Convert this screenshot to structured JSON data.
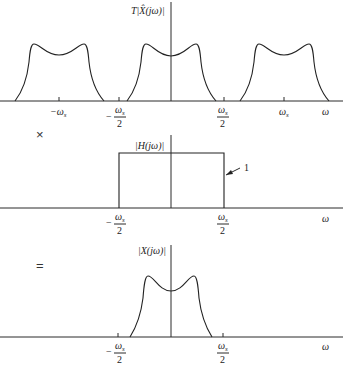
{
  "figure": {
    "type": "sampling-reconstruction-diagram",
    "panels": [
      {
        "id": "sampled-spectrum",
        "ylabel": "T|X̂(jω)|",
        "xlabel": "ω",
        "lobe_centers": [
          "-ω_s",
          "0",
          "ω_s"
        ],
        "ticks": [
          {
            "label_num": "−ω",
            "label_sub": "s",
            "kind": "plain",
            "at": "-ws"
          },
          {
            "label_num": "ω",
            "label_sub": "s",
            "kind": "frac-neg",
            "at": "-ws/2"
          },
          {
            "label_num": "ω",
            "label_sub": "s",
            "kind": "frac",
            "at": "ws/2"
          },
          {
            "label_num": "ω",
            "label_sub": "s",
            "kind": "plain",
            "at": "ws"
          }
        ]
      },
      {
        "id": "lowpass-filter",
        "operator": "×",
        "ylabel": "|H(jω)|",
        "xlabel": "ω",
        "gain_label": "1",
        "passband": [
          "-ω_s/2",
          "ω_s/2"
        ]
      },
      {
        "id": "reconstructed-spectrum",
        "operator": "=",
        "ylabel": "|X(jω)|",
        "xlabel": "ω"
      }
    ],
    "fraction_denominator": "2",
    "minus_sign": "−"
  }
}
